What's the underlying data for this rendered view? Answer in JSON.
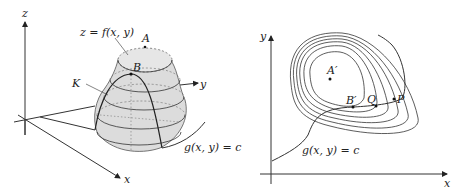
{
  "left_figure": {
    "axes": {
      "z": "z",
      "y": "y",
      "x": "x"
    },
    "surface_label": "z = f(x, y)",
    "point_A": "A",
    "point_B": "B",
    "curve_K": "K",
    "constraint_label": "g(x, y) = c"
  },
  "right_figure": {
    "axes": {
      "y": "y",
      "x": "x"
    },
    "point_A": "A′",
    "point_B": "B′",
    "point_Q": "Q",
    "point_P": "P",
    "constraint_label": "g(x, y) = c"
  },
  "colors": {
    "surface_fill": "#dcdcdc",
    "line": "#333333",
    "dashed": "#666666"
  }
}
